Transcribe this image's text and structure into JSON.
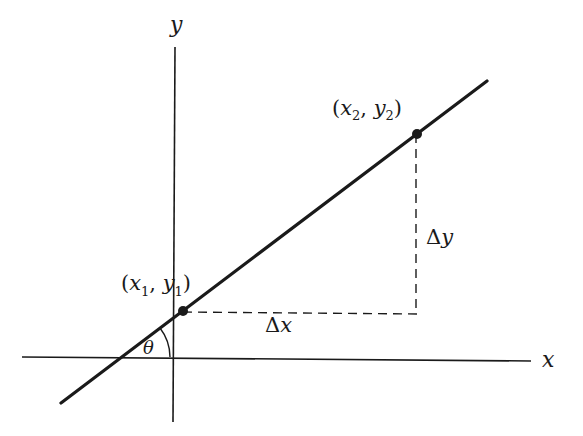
{
  "diagram": {
    "colors": {
      "background": "#ffffff",
      "ink": "#1a1a1a"
    },
    "axes": {
      "x_label": "x",
      "y_label": "y"
    },
    "points": [
      {
        "id": "p1",
        "label_open": "(",
        "x_sym": "x",
        "x_sub": "1",
        "sep": ", ",
        "y_sym": "y",
        "y_sub": "1",
        "label_close": ")"
      },
      {
        "id": "p2",
        "label_open": "(",
        "x_sym": "x",
        "x_sub": "2",
        "sep": ", ",
        "y_sym": "y",
        "y_sub": "2",
        "label_close": ")"
      }
    ],
    "delta_x": {
      "delta": "Δ",
      "var": "x"
    },
    "delta_y": {
      "delta": "Δ",
      "var": "y"
    },
    "angle_label": "θ"
  }
}
